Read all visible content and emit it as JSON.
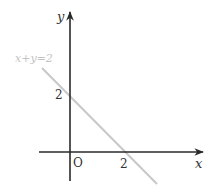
{
  "diagram": {
    "type": "coordinate-graph",
    "axes": {
      "x_label": "x",
      "y_label": "y",
      "origin_label": "O"
    },
    "line": {
      "equation_label": "x+y=2",
      "x_intercept_label": "2",
      "y_intercept_label": "2",
      "color": "#c8c8c8"
    },
    "colors": {
      "axis": "#2a2a2a",
      "label": "#333333",
      "equation_label": "#c4c4c4"
    }
  }
}
